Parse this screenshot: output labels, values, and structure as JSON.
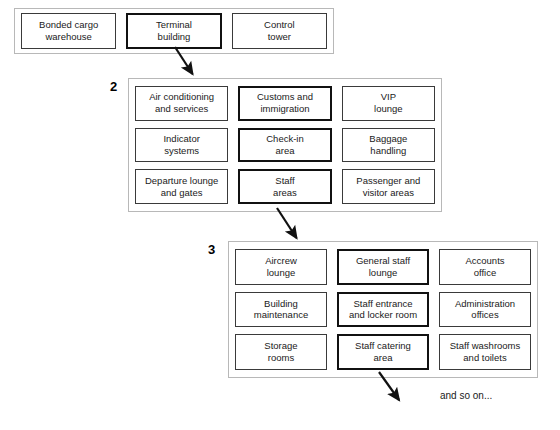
{
  "diagram": {
    "type": "hierarchical-decomposition",
    "levels": [
      {
        "number": "",
        "label_visible": false,
        "nodes": [
          {
            "label": "Bonded cargo\nwarehouse",
            "emphasis": false
          },
          {
            "label": "Terminal\nbuilding",
            "emphasis": true
          },
          {
            "label": "Control\ntower",
            "emphasis": false
          }
        ]
      },
      {
        "number": "2",
        "label_visible": true,
        "nodes": [
          {
            "label": "Air conditioning\nand services",
            "emphasis": false
          },
          {
            "label": "Customs and\nimmigration",
            "emphasis": true
          },
          {
            "label": "VIP\nlounge",
            "emphasis": false
          },
          {
            "label": "Indicator\nsystems",
            "emphasis": false
          },
          {
            "label": "Check-in\narea",
            "emphasis": true
          },
          {
            "label": "Baggage\nhandling",
            "emphasis": false
          },
          {
            "label": "Departure lounge\nand gates",
            "emphasis": false
          },
          {
            "label": "Staff\nareas",
            "emphasis": true
          },
          {
            "label": "Passenger and\nvisitor areas",
            "emphasis": false
          }
        ]
      },
      {
        "number": "3",
        "label_visible": true,
        "nodes": [
          {
            "label": "Aircrew\nlounge",
            "emphasis": false
          },
          {
            "label": "General staff\nlounge",
            "emphasis": true
          },
          {
            "label": "Accounts\noffice",
            "emphasis": false
          },
          {
            "label": "Building\nmaintenance",
            "emphasis": false
          },
          {
            "label": "Staff entrance\nand locker room",
            "emphasis": true
          },
          {
            "label": "Administration\noffices",
            "emphasis": false
          },
          {
            "label": "Storage\nrooms",
            "emphasis": false
          },
          {
            "label": "Staff catering\narea",
            "emphasis": true
          },
          {
            "label": "Staff washrooms\nand toilets",
            "emphasis": false
          }
        ]
      }
    ],
    "connectors": [
      {
        "name": "terminal-building-to-level-2",
        "from": "Terminal building",
        "to": "level 2 group"
      },
      {
        "name": "staff-areas-to-level-3",
        "from": "Staff areas",
        "to": "level 3 group"
      },
      {
        "name": "staff-catering-area-to-next",
        "from": "Staff catering area",
        "to": "and so on..."
      }
    ],
    "tail_caption": "and so on...",
    "colors": {
      "background": "#ffffff",
      "node_border": "#3a3a3a",
      "node_border_emphasis": "#111111",
      "group_border": "#b8b8b8",
      "text": "#1a1a1a",
      "arrow": "#111111"
    }
  }
}
